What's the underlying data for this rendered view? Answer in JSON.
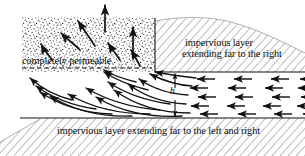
{
  "figure": {
    "type": "hydrogeology-cross-section",
    "width": 305,
    "height": 156,
    "background": "#ffffff",
    "ink": "#111111",
    "hatch_color": "#8e8e8e",
    "stipple_color": "#1a1a1a"
  },
  "labels": {
    "permeable": "completely permeable",
    "impervious_right_line1": "impervious layer",
    "impervious_right_line2": "extending far to the right",
    "impervious_bottom": "impervious layer extending far to the left and right",
    "head_symbol": "h"
  },
  "regions": {
    "permeable_zone": {
      "name": "completely permeable",
      "fill": "stipple",
      "x": 22,
      "y": 17,
      "width": 133,
      "height": 55
    },
    "impervious_upper_right": {
      "name": "impervious layer extending far to the right",
      "fill": "diagonal-hatch",
      "x": 155,
      "y": 20,
      "width": 150,
      "height": 52
    },
    "impervious_bottom": {
      "name": "impervious layer extending far to the left and right",
      "fill": "diagonal-hatch",
      "x": 0,
      "y": 118,
      "width": 305,
      "height": 38
    },
    "aquifer": {
      "name": "confined aquifer flow zone",
      "y_top": 72,
      "y_bottom": 118
    }
  },
  "annotations": {
    "head_dimension": {
      "symbol": "h",
      "x": 175,
      "y_top": 72,
      "y_bottom": 118,
      "style": "double-headed-vertical-arrow"
    },
    "water_table_dashed_line": {
      "y": 68,
      "x_start": 22,
      "x_end": 150,
      "style": "dashed"
    }
  },
  "flow": {
    "horizontal_arrow_rows": [
      {
        "y": 79,
        "x_tails": [
          203,
          240,
          275,
          300
        ],
        "direction": "left"
      },
      {
        "y": 88,
        "x_tails": [
          197,
          235,
          270,
          300
        ],
        "direction": "left"
      },
      {
        "y": 97,
        "x_tails": [
          203,
          240,
          276,
          300
        ],
        "direction": "left"
      },
      {
        "y": 106,
        "x_tails": [
          197,
          233,
          268,
          300
        ],
        "direction": "left"
      },
      {
        "y": 114,
        "x_tails": [
          205,
          243,
          278,
          300
        ],
        "direction": "left"
      }
    ],
    "vertical_exit_arrows": [
      {
        "x": 105,
        "y_tail": 30,
        "y_head": 6
      },
      {
        "x": 133,
        "y_tail": 52,
        "y_head": 28
      }
    ],
    "inclined_arrows_in_permeable": [
      {
        "x1": 52,
        "y1": 58,
        "x2": 42,
        "y2": 46
      },
      {
        "x1": 78,
        "y1": 48,
        "x2": 62,
        "y2": 36
      },
      {
        "x1": 92,
        "y1": 44,
        "x2": 78,
        "y2": 22
      },
      {
        "x1": 118,
        "y1": 58,
        "x2": 110,
        "y2": 44
      }
    ],
    "curved_streamlines": 12,
    "direction_description": "flow from right to left through confined aquifer, turning upward into the completely permeable zone"
  }
}
